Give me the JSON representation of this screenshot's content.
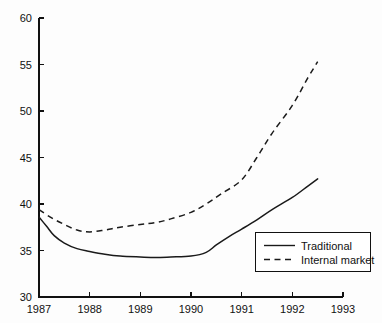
{
  "chart_data": {
    "type": "line",
    "title": "",
    "subtitle": "",
    "xlabel": "",
    "ylabel": "",
    "xlim": [
      1987,
      1993
    ],
    "ylim": [
      30,
      60
    ],
    "x_ticks": [
      1987,
      1988,
      1989,
      1990,
      1991,
      1992,
      1993
    ],
    "x_tick_labels": [
      "1987",
      "1988",
      "1989",
      "1990",
      "1991",
      "1992",
      "1993"
    ],
    "y_ticks": [
      30,
      35,
      40,
      45,
      50,
      55,
      60
    ],
    "y_tick_labels": [
      "30",
      "35",
      "40",
      "45",
      "50",
      "55",
      "60"
    ],
    "grid": false,
    "legend_position": "bottom-right",
    "series": [
      {
        "name": "Traditional",
        "style": "solid",
        "color": "#1a1a1a",
        "x": [
          1987.0,
          1987.15,
          1987.3,
          1987.5,
          1987.75,
          1988.0,
          1988.3,
          1988.6,
          1989.0,
          1989.3,
          1989.6,
          1990.0,
          1990.3,
          1990.5,
          1990.75,
          1991.0,
          1991.3,
          1991.6,
          1992.0,
          1992.3,
          1992.5
        ],
        "values": [
          38.6,
          37.6,
          36.6,
          35.8,
          35.2,
          34.9,
          34.6,
          34.4,
          34.3,
          34.25,
          34.3,
          34.4,
          34.8,
          35.6,
          36.5,
          37.3,
          38.3,
          39.4,
          40.7,
          41.9,
          42.7
        ]
      },
      {
        "name": "Internal market",
        "style": "dashed",
        "color": "#1a1a1a",
        "x": [
          1987.0,
          1987.25,
          1987.5,
          1987.75,
          1988.0,
          1988.3,
          1988.6,
          1989.0,
          1989.3,
          1989.6,
          1990.0,
          1990.3,
          1990.6,
          1991.0,
          1991.3,
          1991.6,
          1992.0,
          1992.3,
          1992.5
        ],
        "values": [
          39.4,
          38.5,
          37.8,
          37.2,
          37.0,
          37.2,
          37.5,
          37.8,
          38.0,
          38.4,
          39.1,
          40.0,
          41.1,
          42.6,
          45.0,
          47.6,
          50.6,
          53.5,
          55.3
        ]
      }
    ],
    "legend": [
      {
        "label": "Traditional",
        "style": "solid"
      },
      {
        "label": "Internal market",
        "style": "dashed"
      }
    ]
  },
  "colors": {
    "ink": "#1a1a1a",
    "axis": "#111111",
    "background": "#fdfdfd"
  }
}
